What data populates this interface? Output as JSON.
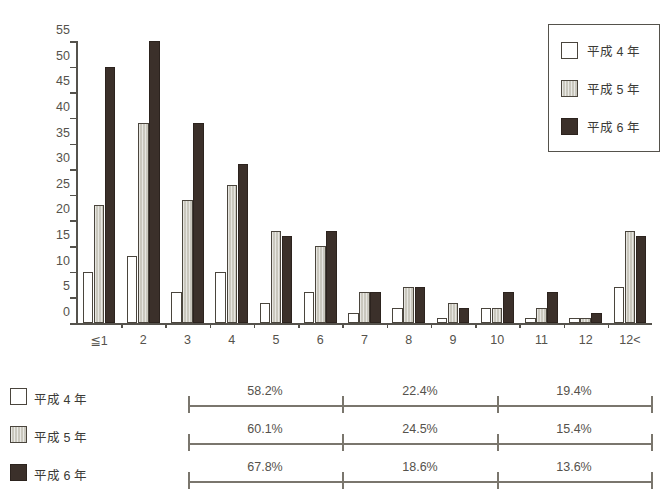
{
  "chart_data": {
    "type": "bar",
    "title": "",
    "xlabel": "",
    "ylabel": "",
    "ylim": [
      0,
      55
    ],
    "ytick_step": 5,
    "grid": false,
    "legend_position": "top-right",
    "categories": [
      "≦1",
      "2",
      "3",
      "4",
      "5",
      "6",
      "7",
      "8",
      "9",
      "10",
      "11",
      "12",
      "12<"
    ],
    "yticks": [
      "0",
      "5",
      "10",
      "15",
      "20",
      "25",
      "30",
      "35",
      "40",
      "45",
      "50",
      "55"
    ],
    "series": [
      {
        "name": "平成24年",
        "label": "平成 4 年",
        "color": "#ffffff",
        "values": [
          10,
          13,
          6,
          10,
          4,
          6,
          2,
          3,
          1,
          3,
          1,
          1,
          7
        ]
      },
      {
        "name": "平成25年",
        "label": "平成 5 年",
        "color": "#c9c7bd",
        "values": [
          23,
          39,
          24,
          27,
          18,
          15,
          6,
          7,
          4,
          3,
          3,
          1,
          18
        ]
      },
      {
        "name": "平成26年",
        "label": "平成 6 年",
        "color": "#3b302a",
        "values": [
          50,
          55,
          39,
          31,
          17,
          18,
          6,
          7,
          3,
          6,
          6,
          2,
          17
        ]
      }
    ]
  },
  "legend": {
    "items": [
      {
        "label": "平成 4 年",
        "swatch": "white"
      },
      {
        "label": "平成 5 年",
        "swatch": "gray"
      },
      {
        "label": "平成 6 年",
        "swatch": "dark"
      }
    ]
  },
  "percent_table": {
    "segment_count": 3,
    "rows": [
      {
        "label": "平成 4 年",
        "swatch": "white",
        "values": [
          "58.2%",
          "22.4%",
          "19.4%"
        ]
      },
      {
        "label": "平成 5 年",
        "swatch": "gray",
        "values": [
          "60.1%",
          "24.5%",
          "15.4%"
        ]
      },
      {
        "label": "平成 6 年",
        "swatch": "dark",
        "values": [
          "67.8%",
          "18.6%",
          "13.6%"
        ]
      }
    ]
  },
  "colors": {
    "series_white": "#ffffff",
    "series_gray": "#c9c7bd",
    "series_dark": "#3b302a",
    "axis": "#55524c",
    "text": "#3b3a36"
  }
}
